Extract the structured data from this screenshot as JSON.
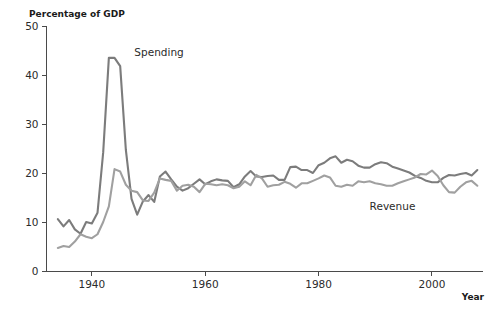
{
  "chart_data": {
    "type": "line",
    "title": "",
    "ylabel": "Percentage of GDP",
    "xlabel": "Year",
    "xlim": [
      1932,
      2009
    ],
    "ylim": [
      0,
      50
    ],
    "yticks": [
      0,
      10,
      20,
      30,
      40,
      50
    ],
    "ytick_labels": [
      "0",
      "10",
      "20",
      "30",
      "40",
      "50"
    ],
    "xticks": [
      1940,
      1960,
      1980,
      2000
    ],
    "xtick_labels": [
      "1940",
      "1960",
      "1980",
      "2000"
    ],
    "grid": false,
    "legend": "inline-annotations",
    "annotations": [
      {
        "text": "Spending",
        "x": 1947.5,
        "y": 44.0
      },
      {
        "text": "Revenue",
        "x": 1989.0,
        "y": 12.6
      }
    ],
    "series": [
      {
        "name": "Spending",
        "color": "#7c7c7c",
        "x": [
          1934,
          1935,
          1936,
          1937,
          1938,
          1939,
          1940,
          1941,
          1942,
          1943,
          1944,
          1945,
          1946,
          1947,
          1948,
          1949,
          1950,
          1951,
          1952,
          1953,
          1954,
          1955,
          1956,
          1957,
          1958,
          1959,
          1960,
          1961,
          1962,
          1963,
          1964,
          1965,
          1966,
          1967,
          1968,
          1969,
          1970,
          1971,
          1972,
          1973,
          1974,
          1975,
          1976,
          1977,
          1978,
          1979,
          1980,
          1981,
          1982,
          1983,
          1984,
          1985,
          1986,
          1987,
          1988,
          1989,
          1990,
          1991,
          1992,
          1993,
          1994,
          1995,
          1996,
          1997,
          1998,
          1999,
          2000,
          2001,
          2002,
          2003,
          2004,
          2005,
          2006,
          2007,
          2008
        ],
        "values": [
          10.7,
          9.2,
          10.5,
          8.6,
          7.7,
          10.1,
          9.8,
          12.0,
          24.3,
          43.6,
          43.6,
          41.9,
          24.8,
          14.8,
          11.6,
          14.3,
          15.6,
          14.2,
          19.4,
          20.4,
          18.8,
          17.3,
          16.5,
          17.0,
          17.9,
          18.8,
          17.8,
          18.4,
          18.8,
          18.6,
          18.5,
          17.2,
          17.8,
          19.4,
          20.5,
          19.4,
          19.3,
          19.5,
          19.6,
          18.7,
          18.7,
          21.3,
          21.4,
          20.7,
          20.7,
          20.1,
          21.7,
          22.2,
          23.1,
          23.5,
          22.2,
          22.8,
          22.5,
          21.6,
          21.2,
          21.2,
          21.9,
          22.3,
          22.1,
          21.4,
          21.0,
          20.6,
          20.2,
          19.5,
          19.1,
          18.5,
          18.2,
          18.2,
          19.1,
          19.7,
          19.6,
          19.9,
          20.1,
          19.6,
          20.7
        ]
      },
      {
        "name": "Revenue",
        "color": "#a0a0a0",
        "x": [
          1934,
          1935,
          1936,
          1937,
          1938,
          1939,
          1940,
          1941,
          1942,
          1943,
          1944,
          1945,
          1946,
          1947,
          1948,
          1949,
          1950,
          1951,
          1952,
          1953,
          1954,
          1955,
          1956,
          1957,
          1958,
          1959,
          1960,
          1961,
          1962,
          1963,
          1964,
          1965,
          1966,
          1967,
          1968,
          1969,
          1970,
          1971,
          1972,
          1973,
          1974,
          1975,
          1976,
          1977,
          1978,
          1979,
          1980,
          1981,
          1982,
          1983,
          1984,
          1985,
          1986,
          1987,
          1988,
          1989,
          1990,
          1991,
          1992,
          1993,
          1994,
          1995,
          1996,
          1997,
          1998,
          1999,
          2000,
          2001,
          2002,
          2003,
          2004,
          2005,
          2006,
          2007,
          2008
        ],
        "values": [
          4.8,
          5.2,
          5.0,
          6.1,
          7.6,
          7.1,
          6.8,
          7.6,
          10.1,
          13.3,
          20.9,
          20.4,
          17.7,
          16.5,
          16.2,
          14.5,
          14.4,
          16.1,
          19.0,
          18.7,
          18.5,
          16.5,
          17.5,
          17.7,
          17.3,
          16.2,
          17.9,
          17.8,
          17.6,
          17.8,
          17.6,
          17.0,
          17.3,
          18.4,
          17.6,
          19.7,
          19.0,
          17.3,
          17.6,
          17.7,
          18.3,
          17.9,
          17.1,
          18.0,
          18.0,
          18.5,
          19.0,
          19.6,
          19.2,
          17.5,
          17.3,
          17.7,
          17.5,
          18.4,
          18.2,
          18.4,
          18.0,
          17.8,
          17.5,
          17.5,
          18.0,
          18.4,
          18.8,
          19.2,
          19.9,
          19.8,
          20.6,
          19.5,
          17.6,
          16.2,
          16.1,
          17.3,
          18.2,
          18.5,
          17.5
        ]
      }
    ]
  },
  "labels": {
    "y_axis_title": "Percentage of GDP",
    "x_axis_title": "Year"
  }
}
